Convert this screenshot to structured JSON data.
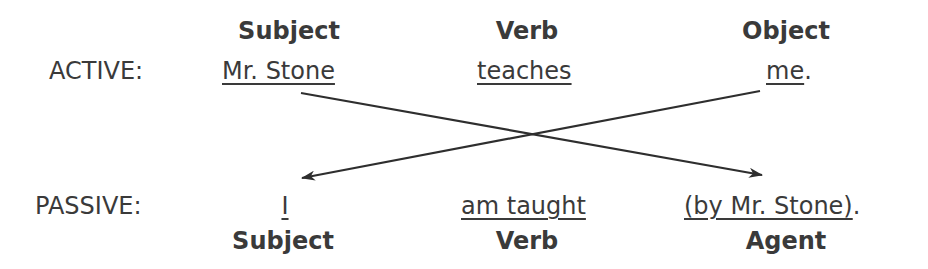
{
  "active": {
    "label": "ACTIVE:",
    "headers": {
      "subject": "Subject",
      "verb": "Verb",
      "object": "Object"
    },
    "words": {
      "subject": "Mr. Stone",
      "verb": "teaches",
      "object": "me",
      "period": "."
    }
  },
  "passive": {
    "label": "PASSIVE:",
    "headers": {
      "subject": "Subject",
      "verb": "Verb",
      "agent": "Agent"
    },
    "words": {
      "subject": "I",
      "verb": "am taught",
      "agent": "(by Mr. Stone)",
      "period": "."
    }
  },
  "arrows": [
    {
      "from": "active.subject",
      "to": "passive.agent"
    },
    {
      "from": "active.object",
      "to": "passive.subject"
    }
  ],
  "colors": {
    "text": "#3a3a3a",
    "arrow": "#2e2e2e"
  }
}
